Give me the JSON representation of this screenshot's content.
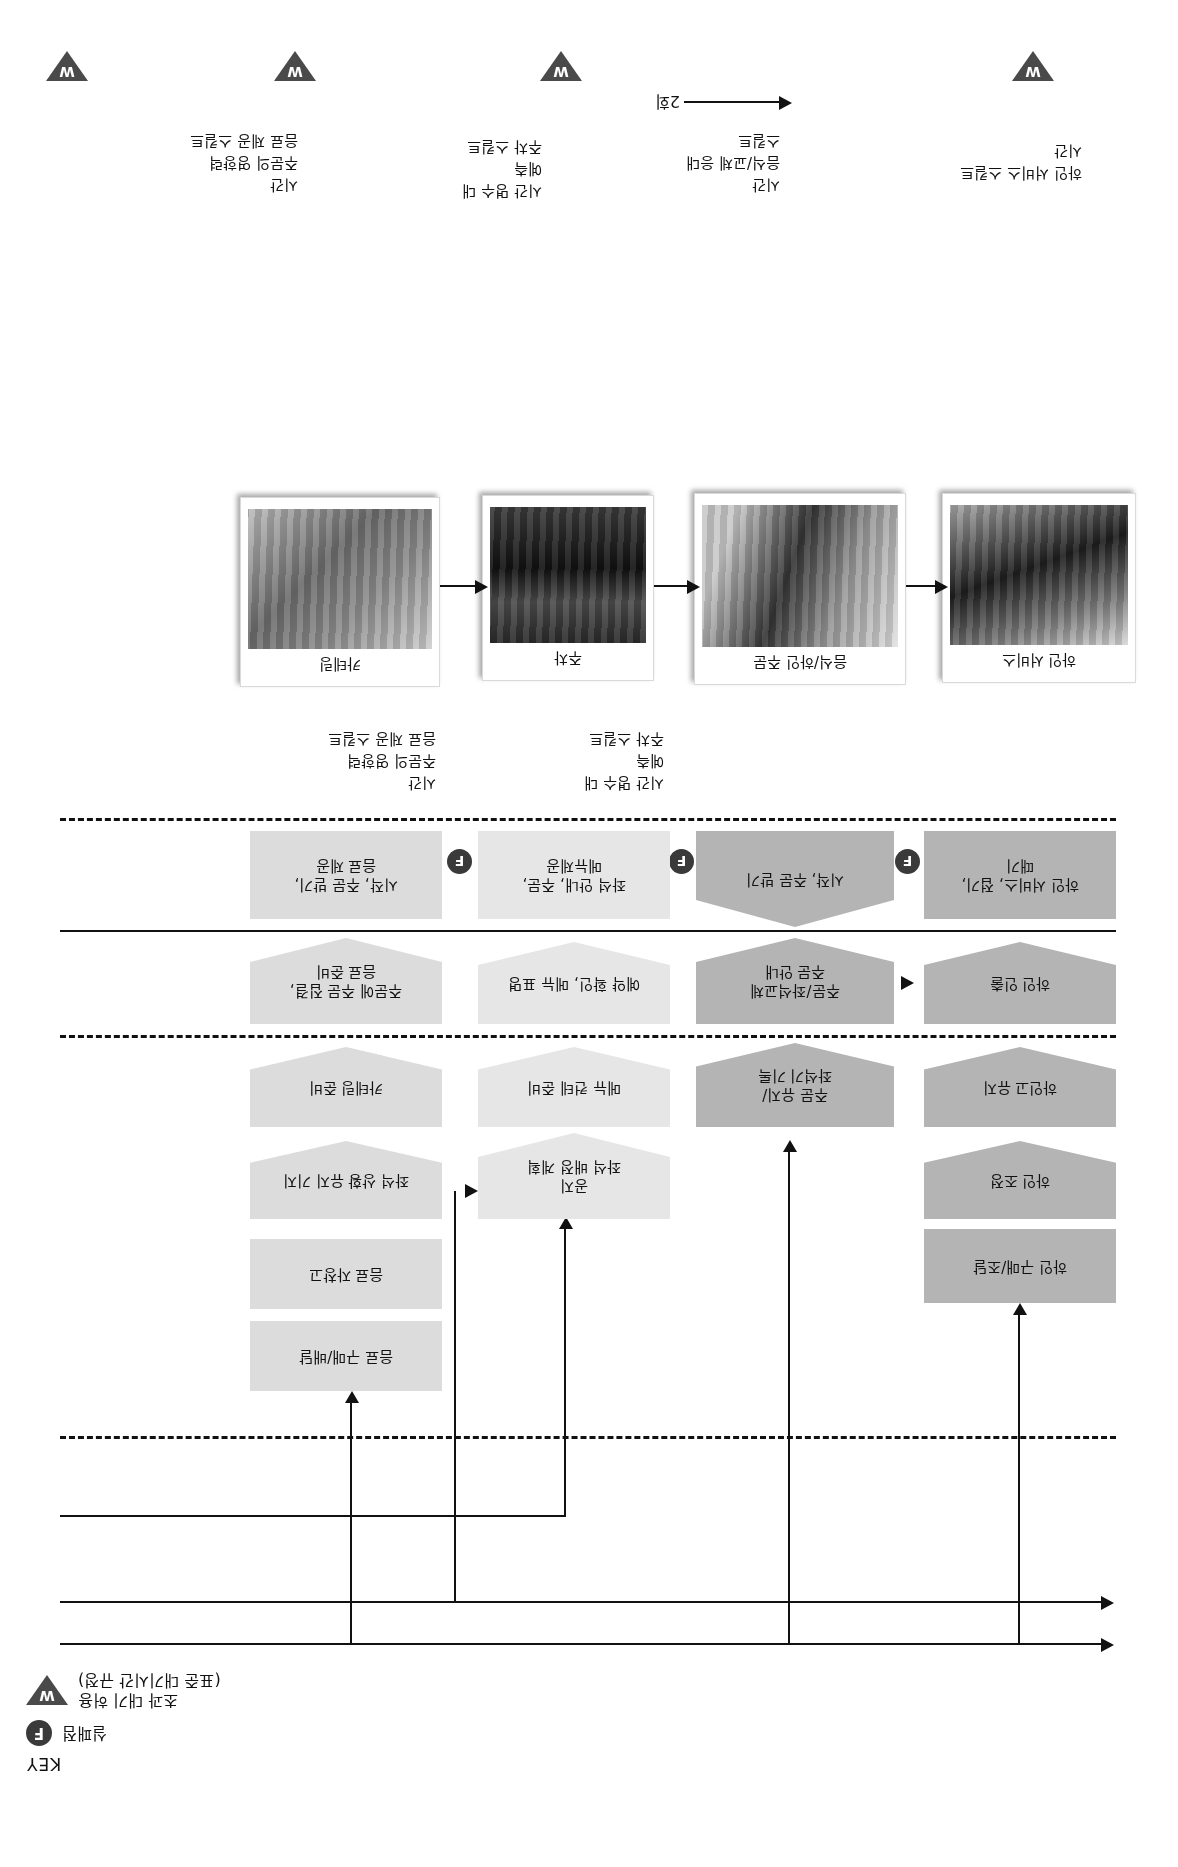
{
  "document": {
    "type": "service-blueprint",
    "orientation": "rotated-180",
    "key_title": "KEY"
  },
  "key": {
    "title": "KEY",
    "items": [
      {
        "symbol": "F",
        "symbol_name": "fail-point-badge",
        "label": "실패점"
      },
      {
        "symbol": "W",
        "symbol_name": "wait-badge",
        "label_line1": "초과 대기 허용",
        "label_line2": "(표준 대기시간 규정)"
      }
    ]
  },
  "cycle": {
    "label": "2회"
  },
  "photos": [
    {
      "caption": "카테링",
      "name": "photo-catering"
    },
    {
      "caption": "주차",
      "name": "photo-parking"
    },
    {
      "caption": "음식/하인 주문",
      "name": "photo-food-order"
    },
    {
      "caption": "하인 서비스",
      "name": "photo-service"
    }
  ],
  "evidence_bullets": [
    {
      "items": [
        "시간",
        "주문의 영향력",
        "음료 제공 스킬트"
      ]
    },
    {
      "items": [
        "시간 명수 대",
        "예측",
        "주차 스킬트"
      ]
    },
    {
      "items": [
        "시간",
        "음식/교체 응대",
        "스킬트"
      ]
    },
    {
      "items": [
        "하인 서비스 스킬트",
        "시간"
      ]
    }
  ],
  "customer_actions": [
    {
      "label_line1": "시작, 주문 받기,",
      "label_line2": "음료 제공",
      "fail_point": "F",
      "tone": "g-light",
      "name": "action-order-drinks"
    },
    {
      "label_line1": "좌석 안내, 주문,",
      "label_line2": "메뉴제공",
      "fail_point": "F",
      "tone": "g-pale",
      "name": "action-seat-menu"
    },
    {
      "label_line1": "시작, 주문 받기",
      "fail_point": "F",
      "tone": "g-mid",
      "name": "action-take-order"
    },
    {
      "label_line1": "하인 서비스, 접기,",
      "label_line2": "때기",
      "tone": "g-mid",
      "name": "action-service-wait"
    }
  ],
  "onstage_contact": [
    {
      "label_line1": "주문에 주문 집결,",
      "label_line2": "음료 준비",
      "tone": "g-light",
      "name": "onstage-prep-drinks"
    },
    {
      "label_line1": "예약 확인, 메뉴 표명",
      "tone": "g-pale",
      "name": "onstage-confirm-menu"
    },
    {
      "label_line1": "주문/좌석교체",
      "label_line2": "주문 안내",
      "tone": "g-mid",
      "name": "onstage-order-guide"
    },
    {
      "label_line1": "하인 인출",
      "tone": "g-mid",
      "name": "onstage-serve"
    }
  ],
  "backstage_contact": [
    {
      "label_line1": "카테링 준비",
      "tone": "g-light",
      "name": "backstage-catering-prep"
    },
    {
      "label_line1": "메뉴 컨테 준비",
      "tone": "g-pale",
      "name": "backstage-menu-prep"
    },
    {
      "label_line1": "주문 유지/",
      "label_line2": "좌석기 기록",
      "tone": "g-mid",
      "name": "backstage-record"
    },
    {
      "label_line1": "하인고 유지",
      "tone": "g-mid",
      "name": "backstage-hold"
    }
  ],
  "support_processes": [
    {
      "label_line1": "좌석 상황 유지 기지",
      "tone": "g-light",
      "name": "support-seat-status"
    },
    {
      "label_line1": "좌석 배정 계획",
      "label_line2": "공지",
      "tone": "g-pale",
      "name": "support-seat-plan"
    },
    {
      "label_line1": "하인 조정",
      "tone": "g-mid",
      "name": "support-adjust"
    }
  ],
  "procurement": [
    {
      "label_line1": "음료 자창고",
      "tone": "g-light",
      "name": "proc-drink-store"
    },
    {
      "label_line1": "음료 구매/배달",
      "tone": "g-light",
      "name": "proc-drink-buy"
    },
    {
      "label_line1": "하인 구매/조달",
      "tone": "g-mid",
      "name": "proc-service-buy"
    }
  ],
  "wait_markers": [
    "W",
    "W",
    "W",
    "W"
  ]
}
